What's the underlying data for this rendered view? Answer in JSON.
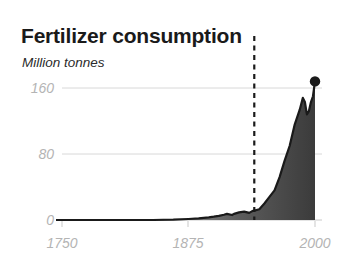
{
  "chart": {
    "title": "Fertilizer consumption",
    "subtitle": "Million tonnes"
  },
  "chart_data": {
    "type": "area",
    "title": "Fertilizer consumption",
    "subtitle": "Million tonnes",
    "xlabel": "",
    "ylabel": "Million tonnes",
    "xlim": [
      1700,
      2010
    ],
    "ylim": [
      0,
      180
    ],
    "grid": true,
    "legend": null,
    "yticks": [
      0,
      80,
      160
    ],
    "ytick_labels": [
      "0",
      "80",
      "160"
    ],
    "xticks": [
      1750,
      1875,
      2000
    ],
    "xtick_labels": [
      "1750",
      "1875",
      "2000"
    ],
    "annotations": [
      {
        "name": "reference-line",
        "type": "vertical-dashed-line",
        "x": 1940,
        "color": "#1a1a1a"
      },
      {
        "name": "endpoint-marker",
        "type": "dot",
        "x": 2000,
        "y": 168,
        "color": "#1a1a1a"
      }
    ],
    "fill_gradient": {
      "from": "#efefef",
      "to": "#3d3d3d"
    },
    "line_color": "#1a1a1a",
    "x": [
      1700,
      1750,
      1800,
      1840,
      1860,
      1875,
      1885,
      1890,
      1895,
      1900,
      1905,
      1910,
      1913,
      1918,
      1920,
      1925,
      1930,
      1935,
      1938,
      1940,
      1945,
      1950,
      1955,
      1960,
      1965,
      1970,
      1975,
      1980,
      1985,
      1988,
      1990,
      1992,
      1994,
      1996,
      1998,
      2000
    ],
    "values": [
      0,
      0,
      0,
      0,
      0.4,
      1.2,
      2.0,
      2.6,
      3.2,
      4.0,
      5.0,
      6.4,
      7.4,
      6.0,
      7.4,
      9.2,
      10.2,
      8.6,
      10.8,
      11.4,
      13.0,
      20.0,
      28.0,
      36.0,
      52.0,
      72.0,
      90.0,
      116.0,
      134.0,
      148.0,
      143.0,
      128.0,
      132.0,
      143.0,
      150.0,
      168.0
    ]
  }
}
